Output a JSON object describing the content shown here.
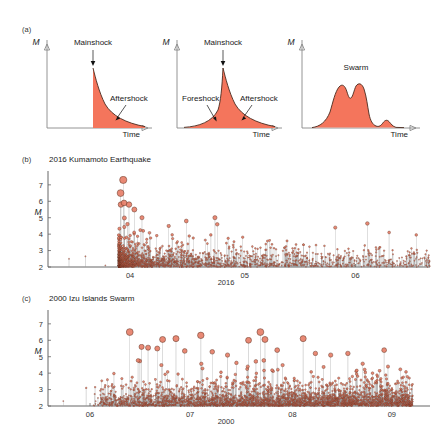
{
  "figure": {
    "width": 437,
    "height": 434,
    "background": "#ffffff",
    "colors": {
      "fill": "#F4755C",
      "marker_fill": "#E8806A",
      "marker_edge": "#5C2E1E",
      "stem": "#9A9A9A",
      "axis": "#888888",
      "text": "#1a1a1a"
    }
  },
  "panel_a": {
    "label": "(a)",
    "axis_y_name": "M",
    "axis_x_name": "Time",
    "subpanels": [
      {
        "name": "mainshock-aftershock",
        "y_axis_label": "M",
        "x_axis_label": "Time",
        "annotations": [
          {
            "text": "Mainshock",
            "kind": "event-arrow-down"
          },
          {
            "text": "Aftershock",
            "kind": "decay-arrow"
          }
        ]
      },
      {
        "name": "foreshock-mainshock-aftershock",
        "y_axis_label": "M",
        "x_axis_label": "Time",
        "annotations": [
          {
            "text": "Mainshock",
            "kind": "event-arrow-down"
          },
          {
            "text": "Foreshock",
            "kind": "rise-arrow"
          },
          {
            "text": "Aftershock",
            "kind": "decay-arrow"
          }
        ]
      },
      {
        "name": "swarm",
        "y_axis_label": "M",
        "x_axis_label": "Time",
        "annotations": [
          {
            "text": "Swarm",
            "kind": "label-only"
          }
        ]
      }
    ]
  },
  "chart_data": [
    {
      "panel": "b",
      "label": "(b)",
      "type": "scatter",
      "title": "2016 Kumamoto Earthquake",
      "ylabel": "M",
      "xlabel": "2016",
      "ylim": [
        2,
        7.6
      ],
      "yticks": [
        2,
        3,
        4,
        5,
        6,
        7
      ],
      "ytick_labels": [
        "2",
        "3",
        "4",
        "5",
        "6",
        "7"
      ],
      "xticks": [
        0.215,
        0.515,
        0.805
      ],
      "xtick_labels": [
        "04",
        "05",
        "06"
      ],
      "grid": false,
      "legend": null,
      "marker": "stem-circle",
      "sequence": {
        "onset_x": 0.185,
        "mainshock": {
          "x": 0.197,
          "M": 7.3
        },
        "foreshock": {
          "x": 0.19,
          "M": 6.5
        },
        "notable": [
          {
            "x": 0.191,
            "M": 5.8
          },
          {
            "x": 0.199,
            "M": 5.9
          },
          {
            "x": 0.212,
            "M": 5.8
          },
          {
            "x": 0.226,
            "M": 5.5
          },
          {
            "x": 0.246,
            "M": 5.0
          },
          {
            "x": 0.316,
            "M": 4.5
          },
          {
            "x": 0.362,
            "M": 4.8
          },
          {
            "x": 0.437,
            "M": 5.0
          },
          {
            "x": 0.443,
            "M": 4.6
          },
          {
            "x": 0.752,
            "M": 4.4
          },
          {
            "x": 0.836,
            "M": 4.65
          },
          {
            "x": 0.893,
            "M": 4.1
          },
          {
            "x": 0.964,
            "M": 3.95
          }
        ],
        "precursors": [
          {
            "x": 0.055,
            "M": 2.5
          },
          {
            "x": 0.098,
            "M": 2.65
          },
          {
            "x": 0.15,
            "M": 2.1
          }
        ],
        "decay_exponent": 0.85,
        "n_events": 2200,
        "baseline_M": 2.0
      }
    },
    {
      "panel": "c",
      "label": "(c)",
      "type": "scatter",
      "title": "2000 Izu Islands Swarm",
      "ylabel": "M",
      "xlabel": "2000",
      "ylim": [
        2,
        7.6
      ],
      "yticks": [
        2,
        3,
        4,
        5,
        6,
        7
      ],
      "ytick_labels": [
        "2",
        "3",
        "4",
        "5",
        "6",
        "7"
      ],
      "xticks": [
        0.11,
        0.372,
        0.64,
        0.9
      ],
      "xtick_labels": [
        "06",
        "07",
        "08",
        "09"
      ],
      "grid": false,
      "legend": null,
      "marker": "stem-circle",
      "sequence": {
        "onset_x": 0.118,
        "end_x": 0.955,
        "notable": [
          {
            "x": 0.214,
            "M": 6.5
          },
          {
            "x": 0.3,
            "M": 6.05
          },
          {
            "x": 0.335,
            "M": 6.1
          },
          {
            "x": 0.4,
            "M": 6.3
          },
          {
            "x": 0.525,
            "M": 6.0
          },
          {
            "x": 0.556,
            "M": 6.5
          },
          {
            "x": 0.568,
            "M": 6.05
          },
          {
            "x": 0.668,
            "M": 6.1
          },
          {
            "x": 0.245,
            "M": 5.6
          },
          {
            "x": 0.262,
            "M": 5.55
          },
          {
            "x": 0.286,
            "M": 5.5
          },
          {
            "x": 0.358,
            "M": 5.35
          },
          {
            "x": 0.43,
            "M": 5.3
          },
          {
            "x": 0.47,
            "M": 5.1
          },
          {
            "x": 0.6,
            "M": 5.4
          },
          {
            "x": 0.7,
            "M": 5.2
          },
          {
            "x": 0.74,
            "M": 5.1
          },
          {
            "x": 0.785,
            "M": 5.2
          },
          {
            "x": 0.88,
            "M": 5.4
          },
          {
            "x": 0.89,
            "M": 4.4
          },
          {
            "x": 0.94,
            "M": 3.1
          }
        ],
        "precursors": [
          {
            "x": 0.04,
            "M": 2.3
          },
          {
            "x": 0.1,
            "M": 3.1
          }
        ],
        "n_events": 3400,
        "baseline_M": 2.0
      }
    }
  ]
}
